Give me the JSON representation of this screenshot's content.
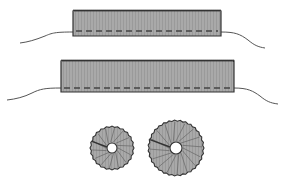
{
  "figure": {
    "width": 286,
    "height": 186,
    "background": "#ffffff",
    "colors": {
      "fill": "#a9a9a9",
      "stripe": "#9a9a9a",
      "outline": "#333333",
      "thread": "#555555",
      "stitch": "#444444",
      "hole": "#ffffff"
    },
    "strips": [
      {
        "name": "short-gathered-strip",
        "x": 73,
        "y": 10,
        "w": 148,
        "h": 26,
        "stitch_y": 31,
        "thread_left": "M73,32 C55,32 52,33 45,36 C35,40 28,42 20,43",
        "thread_right": "M221,32 C235,32 240,34 248,40 C254,45 258,47 265,48"
      },
      {
        "name": "long-gathered-strip",
        "x": 61,
        "y": 60,
        "w": 173,
        "h": 32,
        "stitch_y": 88,
        "thread_left": "M61,88 C45,88 40,89 32,93 C24,97 16,99 7,100",
        "thread_right": "M234,88 C248,88 253,91 260,96 C266,101 270,103 278,104"
      }
    ],
    "rosettes": [
      {
        "name": "small-rosette",
        "cx": 112,
        "cy": 148,
        "r": 22,
        "hole_r": 5,
        "folds": 14
      },
      {
        "name": "large-rosette",
        "cx": 176,
        "cy": 148,
        "r": 28,
        "hole_r": 6,
        "folds": 16
      }
    ]
  }
}
